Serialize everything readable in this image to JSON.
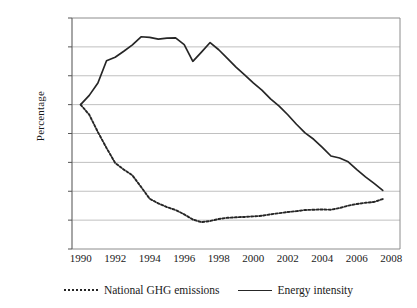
{
  "chart_data": {
    "type": "line",
    "title": "",
    "xlabel": "",
    "ylabel": "Percentage",
    "xlim": [
      1989.5,
      2008.5
    ],
    "ylim": [
      -50,
      30
    ],
    "yticks": [
      30,
      20,
      10,
      0,
      -10,
      -20,
      -30,
      -40,
      -50
    ],
    "ytick_labels": [
      "30",
      "20",
      "10",
      "0",
      "–10",
      "–20",
      "–30",
      "–40",
      "–50"
    ],
    "xticks": [
      1990,
      1992,
      1994,
      1996,
      1998,
      2000,
      2002,
      2004,
      2006,
      2008
    ],
    "xtick_labels": [
      "1990",
      "1992",
      "1994",
      "1996",
      "1998",
      "2000",
      "2002",
      "2004",
      "2006",
      "2008"
    ],
    "grid": "horizontal",
    "legend_position": "bottom",
    "series": [
      {
        "name": "National GHG emissions",
        "style": "dotted",
        "color": "#262626",
        "x": [
          1990.0,
          1990.5,
          1991.0,
          1991.5,
          1992.0,
          1992.5,
          1993.0,
          1993.5,
          1994.0,
          1994.5,
          1995.0,
          1995.5,
          1996.0,
          1996.5,
          1997.0,
          1997.5,
          1998.0,
          1998.5,
          1999.0,
          1999.5,
          2000.0,
          2000.5,
          2001.0,
          2001.5,
          2002.0,
          2002.5,
          2003.0,
          2003.5,
          2004.0,
          2004.5,
          2005.0,
          2005.5,
          2006.0,
          2006.5,
          2007.0,
          2007.5
        ],
        "values": [
          0.0,
          -3.5,
          -9.5,
          -15.0,
          -20.2,
          -22.5,
          -24.5,
          -28.5,
          -32.6,
          -34.2,
          -35.5,
          -36.5,
          -38.0,
          -39.8,
          -40.7,
          -40.3,
          -39.6,
          -39.2,
          -39.0,
          -38.9,
          -38.7,
          -38.5,
          -38.0,
          -37.6,
          -37.2,
          -36.9,
          -36.5,
          -36.4,
          -36.3,
          -36.4,
          -35.8,
          -35.0,
          -34.4,
          -34.0,
          -33.7,
          -32.7
        ]
      },
      {
        "name": "Energy intensity",
        "style": "solid",
        "color": "#262626",
        "x": [
          1990.0,
          1990.5,
          1991.0,
          1991.5,
          1992.0,
          1992.5,
          1993.0,
          1993.5,
          1994.0,
          1994.5,
          1995.0,
          1995.5,
          1996.0,
          1996.5,
          1997.0,
          1997.5,
          1998.0,
          1998.5,
          1999.0,
          1999.5,
          2000.0,
          2000.5,
          2001.0,
          2001.5,
          2002.0,
          2002.5,
          2003.0,
          2003.5,
          2004.0,
          2004.5,
          2005.0,
          2005.5,
          2006.0,
          2006.5,
          2007.0,
          2007.5
        ],
        "values": [
          0.0,
          3.2,
          7.5,
          15.2,
          16.4,
          18.5,
          20.7,
          23.5,
          23.3,
          22.7,
          23.0,
          23.1,
          20.8,
          15.0,
          18.2,
          21.5,
          19.0,
          16.0,
          13.0,
          10.3,
          7.5,
          5.0,
          2.0,
          -0.5,
          -3.5,
          -6.8,
          -9.8,
          -12.0,
          -14.8,
          -17.8,
          -18.5,
          -19.8,
          -22.5,
          -25.0,
          -27.3,
          -29.7
        ]
      }
    ]
  },
  "legend": {
    "items": [
      {
        "label": "National GHG emissions",
        "style": "dotted"
      },
      {
        "label": "Energy intensity",
        "style": "solid"
      }
    ]
  }
}
